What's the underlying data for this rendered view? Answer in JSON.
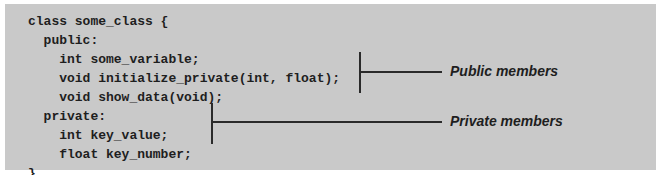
{
  "code": {
    "lines": [
      "class some_class {",
      "  public:",
      "    int some_variable;",
      "    void initialize_private(int, float);",
      "    void show_data(void);",
      "  private:",
      "    int key_value;",
      "    float key_number;",
      "}"
    ]
  },
  "annotations": {
    "public_label": "Public members",
    "private_label": "Private members"
  },
  "colors": {
    "panel_background": "#c9c9c9",
    "text": "#1e1e1e",
    "bracket": "#2a2a2a"
  }
}
